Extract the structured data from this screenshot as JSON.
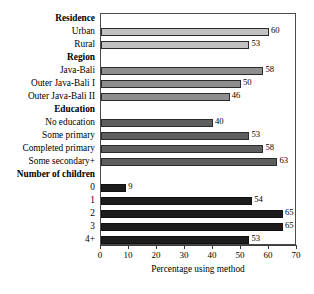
{
  "chart_data": {
    "type": "bar",
    "orientation": "horizontal",
    "title": "",
    "xlabel": "Percentage using method",
    "ylabel": "",
    "xlim": [
      0,
      70
    ],
    "xticks": [
      0,
      10,
      20,
      30,
      40,
      50,
      60,
      70
    ],
    "grid": false,
    "legend": "none",
    "groups": [
      {
        "name": "Residence",
        "tone": "tone-light",
        "color": "#c2c2c2",
        "categories": [
          "Urban",
          "Rural"
        ],
        "values": [
          60,
          53
        ]
      },
      {
        "name": "Region",
        "tone": "tone-mid",
        "color": "#8e8e8e",
        "categories": [
          "Java-Bali",
          "Outer Java-Bali I",
          "Outer Java-Bali II"
        ],
        "values": [
          58,
          50,
          46
        ]
      },
      {
        "name": "Education",
        "tone": "tone-dark",
        "color": "#5e5e5e",
        "categories": [
          "No education",
          "Some primary",
          "Completed primary",
          "Some secondary+"
        ],
        "values": [
          40,
          53,
          58,
          63
        ]
      },
      {
        "name": "Number of children",
        "tone": "tone-black",
        "color": "#1c1c1c",
        "categories": [
          "0",
          "1",
          "2",
          "3",
          "4+"
        ],
        "values": [
          9,
          54,
          65,
          65,
          53
        ]
      }
    ]
  }
}
